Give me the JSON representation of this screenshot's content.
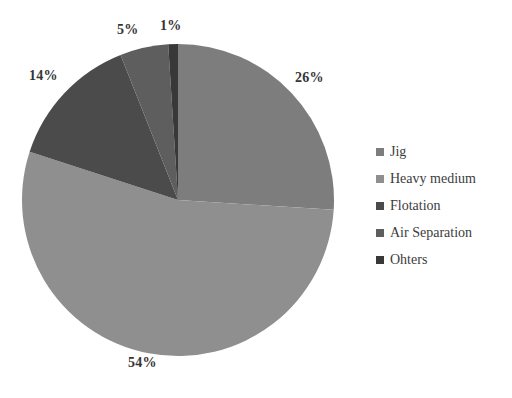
{
  "chart_data": {
    "type": "pie",
    "title": "",
    "subtitle": "",
    "xlabel": "",
    "ylabel": "",
    "grid": false,
    "legend_position": "right",
    "start_angle_deg": 0,
    "direction": "clockwise",
    "categories": [
      "Jig",
      "Heavy medium",
      "Flotation",
      "Air Separation",
      "Ohters"
    ],
    "values": [
      26,
      54,
      14,
      5,
      1
    ],
    "value_unit": "%",
    "data_labels": [
      "26%",
      "54%",
      "14%",
      "5%",
      "1%"
    ],
    "colors": [
      "#7d7d7d",
      "#8f8f8f",
      "#4b4b4b",
      "#5e5e5e",
      "#383838"
    ],
    "slices": [
      {
        "label": "Jig",
        "value": 26,
        "data_label": "26%",
        "color": "#7d7d7d"
      },
      {
        "label": "Heavy medium",
        "value": 54,
        "data_label": "54%",
        "color": "#8f8f8f"
      },
      {
        "label": "Flotation",
        "value": 14,
        "data_label": "14%",
        "color": "#4b4b4b"
      },
      {
        "label": "Air Separation",
        "value": 5,
        "data_label": "5%",
        "color": "#5e5e5e"
      },
      {
        "label": "Ohters",
        "value": 1,
        "data_label": "1%",
        "color": "#383838"
      }
    ]
  },
  "legend": {
    "items": [
      {
        "label": "Jig",
        "color": "#7d7d7d"
      },
      {
        "label": "Heavy medium",
        "color": "#8f8f8f"
      },
      {
        "label": "Flotation",
        "color": "#4b4b4b"
      },
      {
        "label": "Air Separation",
        "color": "#5e5e5e"
      },
      {
        "label": "Ohters",
        "color": "#383838"
      }
    ]
  },
  "labels": {
    "jig_pct": "26%",
    "heavy_medium_pct": "54%",
    "flotation_pct": "14%",
    "air_separation_pct": "5%",
    "ohters_pct": "1%"
  },
  "style": {
    "background": "#ffffff",
    "text_color": "#3a3a3a"
  }
}
